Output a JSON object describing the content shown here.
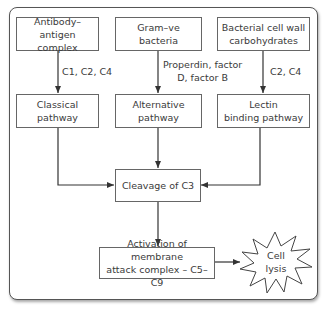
{
  "diagram": {
    "type": "flowchart",
    "triggers": [
      {
        "id": "trigger-antibody",
        "label": "Antibody–antigen\ncomplex"
      },
      {
        "id": "trigger-gram",
        "label": "Gram–ve\nbacteria"
      },
      {
        "id": "trigger-bacterial-wall",
        "label": "Bacterial cell wall\ncarbohydrates"
      }
    ],
    "edge_labels": [
      {
        "id": "edge-classical",
        "label": "C1, C2, C4"
      },
      {
        "id": "edge-alternative",
        "label": "Properdin, factor\nD, factor B"
      },
      {
        "id": "edge-lectin",
        "label": "C2, C4"
      }
    ],
    "pathways": [
      {
        "id": "pathway-classical",
        "label": "Classical\npathway"
      },
      {
        "id": "pathway-alternative",
        "label": "Alternative\npathway"
      },
      {
        "id": "pathway-lectin",
        "label": "Lectin\nbinding pathway"
      }
    ],
    "convergence": {
      "label": "Cleavage of C3"
    },
    "mac": {
      "label": "Activation of membrane\nattack complex – C5–C9"
    },
    "outcome": {
      "label": "Cell\nlysis"
    },
    "colors": {
      "stroke": "#555555",
      "text": "#3a3a3a",
      "background": "#ffffff"
    }
  }
}
